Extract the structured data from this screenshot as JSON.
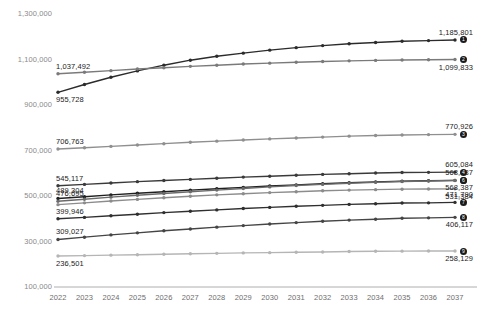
{
  "chart_data": {
    "type": "line",
    "title": "",
    "xlabel": "",
    "ylabel": "",
    "grid": false,
    "legend_position": "none",
    "x": [
      2022,
      2023,
      2024,
      2025,
      2026,
      2027,
      2028,
      2029,
      2030,
      2031,
      2032,
      2033,
      2034,
      2035,
      2036,
      2037
    ],
    "ylim": [
      100000,
      1300000
    ],
    "ytick_labels": [
      "1,300,000",
      "1,100,000",
      "900,000",
      "700,000",
      "500,000",
      "300,000",
      "100,000"
    ],
    "yticks": [
      1300000,
      1100000,
      900000,
      700000,
      500000,
      300000,
      100000
    ],
    "xtick_labels": [
      "2022",
      "2023",
      "2024",
      "2025",
      "2026",
      "2027",
      "2028",
      "2029",
      "2030",
      "2031",
      "2032",
      "2033",
      "2034",
      "2035",
      "2036",
      "2037"
    ],
    "series": [
      {
        "badge": "1",
        "color": "#2b2b2b",
        "start_label": "955,728",
        "end_label": "1,185,801",
        "values": [
          955728,
          990000,
          1022000,
          1050000,
          1075000,
          1097000,
          1114000,
          1128000,
          1141000,
          1152000,
          1161000,
          1169000,
          1175000,
          1180000,
          1183000,
          1185801
        ]
      },
      {
        "badge": "2",
        "color": "#7a7a7a",
        "start_label": "1,037,492",
        "end_label": "1,099,833",
        "values": [
          1037492,
          1044000,
          1051000,
          1058000,
          1064000,
          1070000,
          1075000,
          1080000,
          1084000,
          1088000,
          1091000,
          1094000,
          1096000,
          1098000,
          1099000,
          1099833
        ]
      },
      {
        "badge": "3",
        "color": "#8f8f8f",
        "start_label": "706,763",
        "end_label": "770,926",
        "values": [
          706763,
          712000,
          718000,
          724000,
          730000,
          736000,
          741000,
          746000,
          751000,
          755000,
          759000,
          763000,
          766000,
          768000,
          770000,
          770926
        ]
      },
      {
        "badge": "4",
        "color": "#3a3a3a",
        "start_label": "545,117",
        "end_label": "605,084",
        "values": [
          545117,
          551000,
          557000,
          563000,
          568000,
          573000,
          578000,
          583000,
          587000,
          591000,
          595000,
          598000,
          601000,
          603000,
          604000,
          605084
        ]
      },
      {
        "badge": "5",
        "color": "#1f1f1f",
        "start_label": "489,304",
        "end_label": "568,587",
        "values": [
          489304,
          497000,
          505000,
          512000,
          519000,
          526000,
          532000,
          538000,
          544000,
          549000,
          554000,
          558000,
          562000,
          565000,
          567000,
          568587
        ]
      },
      {
        "badge": "6",
        "color": "#6b6b6b",
        "start_label": "476,695",
        "end_label": "568,387",
        "values": [
          476695,
          486000,
          495000,
          503000,
          511000,
          519000,
          526000,
          533000,
          540000,
          546000,
          551000,
          556000,
          560000,
          564000,
          566000,
          568387
        ]
      },
      {
        "badge": "0",
        "color": "#8c8c8c",
        "start_label": "",
        "end_label": "531,384",
        "values": [
          462000,
          470000,
          478000,
          485000,
          492000,
          499000,
          505000,
          510000,
          515000,
          519000,
          523000,
          526000,
          528000,
          530000,
          531000,
          531384
        ]
      },
      {
        "badge": "7",
        "color": "#2f2f2f",
        "start_label": "399,946",
        "end_label": "471,790",
        "values": [
          399946,
          406000,
          413000,
          420000,
          427000,
          433000,
          439000,
          445000,
          450000,
          455000,
          459000,
          463000,
          466000,
          469000,
          470000,
          471790
        ]
      },
      {
        "badge": "8",
        "color": "#454545",
        "start_label": "309,027",
        "end_label": "406,117",
        "values": [
          309027,
          319000,
          329000,
          338000,
          347000,
          355000,
          363000,
          370000,
          377000,
          383000,
          389000,
          394000,
          398000,
          402000,
          404000,
          406117
        ]
      },
      {
        "badge": "9",
        "color": "#b5b5b5",
        "start_label": "236,501",
        "end_label": "258,129",
        "values": [
          236501,
          238000,
          240000,
          242000,
          244000,
          246000,
          248000,
          250000,
          251000,
          253000,
          254000,
          256000,
          257000,
          257500,
          258000,
          258129
        ]
      }
    ]
  }
}
